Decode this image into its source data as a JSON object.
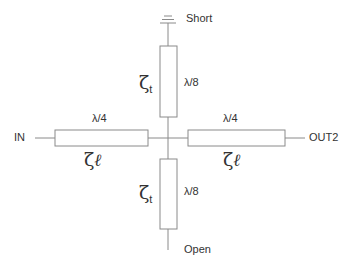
{
  "diagram": {
    "type": "transmission-line-cross-junction",
    "colors": {
      "line": "#8a8a8a",
      "text": "#333333",
      "background": "#ffffff"
    },
    "ports": {
      "input": "IN",
      "output": "OUT2",
      "top_termination": "Short",
      "bottom_termination": "Open"
    },
    "elements": {
      "top_stub": {
        "impedance_symbol": "ζ",
        "impedance_sub": "t",
        "length": "λ/8"
      },
      "bottom_stub": {
        "impedance_symbol": "ζ",
        "impedance_sub": "t",
        "length": "λ/8"
      },
      "left_line": {
        "impedance_symbol": "ζ",
        "impedance_sub": "ℓ",
        "length": "λ/4"
      },
      "right_line": {
        "impedance_symbol": "ζ",
        "impedance_sub": "ℓ",
        "length": "λ/4"
      }
    }
  }
}
